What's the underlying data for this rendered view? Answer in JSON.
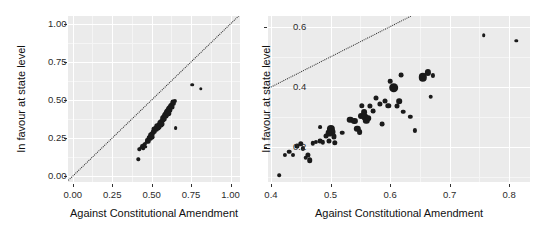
{
  "figure": {
    "type": "scatter-pair",
    "background": "#ffffff",
    "panel_background": "#ebebeb",
    "gridline_color": "#ffffff",
    "point_color": "#1a1a1a",
    "refline_color": "#2b2b2b"
  },
  "chart_data": [
    {
      "type": "scatter",
      "panel": "left",
      "title": "",
      "xlabel": "Against Constitutional Amendment",
      "ylabel": "In favour at state level",
      "xlim": [
        -0.03,
        1.06
      ],
      "ylim": [
        -0.04,
        1.05
      ],
      "xticks": [
        0.0,
        0.25,
        0.5,
        0.75,
        1.0
      ],
      "xticklabels": [
        "0.00",
        "0.25",
        "0.50",
        "0.75",
        "1.00"
      ],
      "yticks": [
        0.0,
        0.25,
        0.5,
        0.75,
        1.0
      ],
      "yticklabels": [
        "0.00",
        "0.25",
        "0.50",
        "0.75",
        "1.00"
      ],
      "grid": true,
      "legend": "none",
      "annotations": [
        {
          "kind": "reference-line",
          "style": "dotted",
          "slope": 1,
          "intercept": 0,
          "label": "y = x"
        }
      ],
      "points": [
        {
          "x": 0.415,
          "y": 0.108,
          "size": 3.4
        },
        {
          "x": 0.423,
          "y": 0.175,
          "size": 3.4
        },
        {
          "x": 0.432,
          "y": 0.186,
          "size": 3.6
        },
        {
          "x": 0.44,
          "y": 0.197,
          "size": 3.8
        },
        {
          "x": 0.447,
          "y": 0.182,
          "size": 3.6
        },
        {
          "x": 0.452,
          "y": 0.205,
          "size": 4.0
        },
        {
          "x": 0.458,
          "y": 0.212,
          "size": 4.2
        },
        {
          "x": 0.463,
          "y": 0.192,
          "size": 3.6
        },
        {
          "x": 0.468,
          "y": 0.222,
          "size": 4.4
        },
        {
          "x": 0.472,
          "y": 0.238,
          "size": 4.0
        },
        {
          "x": 0.478,
          "y": 0.228,
          "size": 4.6
        },
        {
          "x": 0.483,
          "y": 0.248,
          "size": 4.8
        },
        {
          "x": 0.488,
          "y": 0.258,
          "size": 5.2
        },
        {
          "x": 0.492,
          "y": 0.243,
          "size": 4.4
        },
        {
          "x": 0.497,
          "y": 0.268,
          "size": 5.6
        },
        {
          "x": 0.501,
          "y": 0.255,
          "size": 4.8
        },
        {
          "x": 0.505,
          "y": 0.276,
          "size": 5.0
        },
        {
          "x": 0.509,
          "y": 0.286,
          "size": 4.6
        },
        {
          "x": 0.513,
          "y": 0.296,
          "size": 4.8
        },
        {
          "x": 0.518,
          "y": 0.306,
          "size": 5.0
        },
        {
          "x": 0.522,
          "y": 0.291,
          "size": 4.4
        },
        {
          "x": 0.527,
          "y": 0.316,
          "size": 5.2
        },
        {
          "x": 0.531,
          "y": 0.303,
          "size": 4.6
        },
        {
          "x": 0.536,
          "y": 0.326,
          "size": 5.4
        },
        {
          "x": 0.54,
          "y": 0.313,
          "size": 4.8
        },
        {
          "x": 0.545,
          "y": 0.336,
          "size": 5.2
        },
        {
          "x": 0.549,
          "y": 0.323,
          "size": 5.0
        },
        {
          "x": 0.554,
          "y": 0.346,
          "size": 5.4
        },
        {
          "x": 0.558,
          "y": 0.333,
          "size": 4.8
        },
        {
          "x": 0.562,
          "y": 0.356,
          "size": 5.6
        },
        {
          "x": 0.566,
          "y": 0.343,
          "size": 5.0
        },
        {
          "x": 0.57,
          "y": 0.366,
          "size": 5.2
        },
        {
          "x": 0.574,
          "y": 0.378,
          "size": 5.6
        },
        {
          "x": 0.578,
          "y": 0.388,
          "size": 5.4
        },
        {
          "x": 0.582,
          "y": 0.372,
          "size": 4.8
        },
        {
          "x": 0.586,
          "y": 0.398,
          "size": 5.6
        },
        {
          "x": 0.59,
          "y": 0.408,
          "size": 5.8
        },
        {
          "x": 0.594,
          "y": 0.392,
          "size": 5.0
        },
        {
          "x": 0.598,
          "y": 0.418,
          "size": 6.0
        },
        {
          "x": 0.602,
          "y": 0.428,
          "size": 6.2
        },
        {
          "x": 0.606,
          "y": 0.412,
          "size": 5.4
        },
        {
          "x": 0.61,
          "y": 0.438,
          "size": 6.0
        },
        {
          "x": 0.614,
          "y": 0.448,
          "size": 5.8
        },
        {
          "x": 0.618,
          "y": 0.432,
          "size": 5.2
        },
        {
          "x": 0.622,
          "y": 0.458,
          "size": 5.6
        },
        {
          "x": 0.626,
          "y": 0.468,
          "size": 5.4
        },
        {
          "x": 0.63,
          "y": 0.452,
          "size": 5.0
        },
        {
          "x": 0.634,
          "y": 0.478,
          "size": 5.2
        },
        {
          "x": 0.638,
          "y": 0.488,
          "size": 4.8
        },
        {
          "x": 0.642,
          "y": 0.472,
          "size": 4.4
        },
        {
          "x": 0.646,
          "y": 0.494,
          "size": 4.2
        },
        {
          "x": 0.652,
          "y": 0.312,
          "size": 3.8
        },
        {
          "x": 0.758,
          "y": 0.598,
          "size": 3.6
        },
        {
          "x": 0.812,
          "y": 0.572,
          "size": 3.4
        }
      ]
    },
    {
      "type": "scatter",
      "panel": "right",
      "title": "",
      "xlabel": "Against Constitutional Amendment",
      "ylabel": "In favour at state level",
      "xlim": [
        0.395,
        0.835
      ],
      "ylim": [
        0.085,
        0.635
      ],
      "xticks": [
        0.4,
        0.5,
        0.6,
        0.7,
        0.8
      ],
      "xticklabels": [
        "0.4",
        "0.5",
        "0.6",
        "0.7",
        "0.8"
      ],
      "yticks": [
        0.2,
        0.4,
        0.6
      ],
      "yticklabels": [
        "0.2",
        "0.4",
        "0.6"
      ],
      "grid": true,
      "legend": "none",
      "annotations": [
        {
          "kind": "reference-line",
          "style": "dotted",
          "slope": 1,
          "intercept": 0,
          "label": "y = x"
        }
      ],
      "note": "Zoomed view of the same data; point area is proportional to a weight variable.",
      "points": [
        {
          "x": 0.414,
          "y": 0.108,
          "size": 3.6
        },
        {
          "x": 0.423,
          "y": 0.176,
          "size": 4.2
        },
        {
          "x": 0.431,
          "y": 0.186,
          "size": 4.6
        },
        {
          "x": 0.437,
          "y": 0.173,
          "size": 4.0
        },
        {
          "x": 0.444,
          "y": 0.205,
          "size": 5.0
        },
        {
          "x": 0.45,
          "y": 0.212,
          "size": 5.4
        },
        {
          "x": 0.454,
          "y": 0.196,
          "size": 4.2
        },
        {
          "x": 0.458,
          "y": 0.166,
          "size": 4.6
        },
        {
          "x": 0.462,
          "y": 0.175,
          "size": 5.2
        },
        {
          "x": 0.465,
          "y": 0.158,
          "size": 5.6
        },
        {
          "x": 0.47,
          "y": 0.213,
          "size": 4.4
        },
        {
          "x": 0.476,
          "y": 0.218,
          "size": 4.2
        },
        {
          "x": 0.482,
          "y": 0.221,
          "size": 4.8
        },
        {
          "x": 0.487,
          "y": 0.216,
          "size": 4.4
        },
        {
          "x": 0.492,
          "y": 0.238,
          "size": 5.0
        },
        {
          "x": 0.497,
          "y": 0.246,
          "size": 6.8
        },
        {
          "x": 0.5,
          "y": 0.262,
          "size": 8.2
        },
        {
          "x": 0.503,
          "y": 0.252,
          "size": 7.0
        },
        {
          "x": 0.505,
          "y": 0.236,
          "size": 5.2
        },
        {
          "x": 0.507,
          "y": 0.215,
          "size": 5.4
        },
        {
          "x": 0.497,
          "y": 0.222,
          "size": 5.0
        },
        {
          "x": 0.482,
          "y": 0.268,
          "size": 3.8
        },
        {
          "x": 0.52,
          "y": 0.248,
          "size": 4.6
        },
        {
          "x": 0.533,
          "y": 0.291,
          "size": 6.6
        },
        {
          "x": 0.54,
          "y": 0.288,
          "size": 6.2
        },
        {
          "x": 0.545,
          "y": 0.262,
          "size": 6.4
        },
        {
          "x": 0.549,
          "y": 0.251,
          "size": 5.8
        },
        {
          "x": 0.552,
          "y": 0.305,
          "size": 6.0
        },
        {
          "x": 0.556,
          "y": 0.316,
          "size": 5.8
        },
        {
          "x": 0.558,
          "y": 0.3,
          "size": 7.2
        },
        {
          "x": 0.56,
          "y": 0.288,
          "size": 6.4
        },
        {
          "x": 0.563,
          "y": 0.296,
          "size": 5.6
        },
        {
          "x": 0.553,
          "y": 0.338,
          "size": 5.4
        },
        {
          "x": 0.566,
          "y": 0.336,
          "size": 5.2
        },
        {
          "x": 0.572,
          "y": 0.32,
          "size": 4.8
        },
        {
          "x": 0.576,
          "y": 0.362,
          "size": 5.0
        },
        {
          "x": 0.583,
          "y": 0.345,
          "size": 5.2
        },
        {
          "x": 0.587,
          "y": 0.276,
          "size": 4.8
        },
        {
          "x": 0.592,
          "y": 0.352,
          "size": 5.0
        },
        {
          "x": 0.597,
          "y": 0.338,
          "size": 5.4
        },
        {
          "x": 0.6,
          "y": 0.418,
          "size": 4.6
        },
        {
          "x": 0.606,
          "y": 0.398,
          "size": 9.6
        },
        {
          "x": 0.611,
          "y": 0.336,
          "size": 5.0
        },
        {
          "x": 0.615,
          "y": 0.352,
          "size": 5.6
        },
        {
          "x": 0.618,
          "y": 0.438,
          "size": 4.8
        },
        {
          "x": 0.622,
          "y": 0.318,
          "size": 4.6
        },
        {
          "x": 0.634,
          "y": 0.302,
          "size": 4.4
        },
        {
          "x": 0.642,
          "y": 0.256,
          "size": 4.2
        },
        {
          "x": 0.655,
          "y": 0.432,
          "size": 8.4
        },
        {
          "x": 0.663,
          "y": 0.448,
          "size": 6.2
        },
        {
          "x": 0.668,
          "y": 0.368,
          "size": 4.6
        },
        {
          "x": 0.672,
          "y": 0.438,
          "size": 4.2
        },
        {
          "x": 0.757,
          "y": 0.572,
          "size": 3.6
        },
        {
          "x": 0.812,
          "y": 0.552,
          "size": 3.4
        }
      ]
    }
  ]
}
